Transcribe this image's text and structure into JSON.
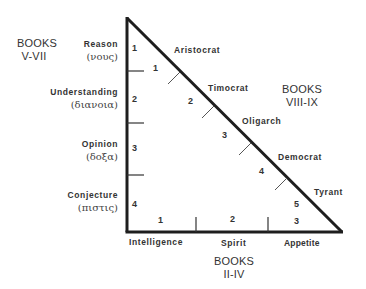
{
  "books_left": {
    "line1": "BOOKS",
    "line2": "V-VII"
  },
  "books_right": {
    "line1": "BOOKS",
    "line2": "VIII-IX"
  },
  "books_bottom": {
    "line1": "BOOKS",
    "line2": "II-IV"
  },
  "faculties": [
    {
      "name": "Reason",
      "greek": "(νους)",
      "num": "1"
    },
    {
      "name": "Understanding",
      "greek": "(διανοια)",
      "num": "2"
    },
    {
      "name": "Opinion",
      "greek": "(δοξα)",
      "num": "3"
    },
    {
      "name": "Conjecture",
      "greek": "(πιστις)",
      "num": "4"
    }
  ],
  "regimes": [
    {
      "name": "Aristocrat",
      "num": "1"
    },
    {
      "name": "Timocrat",
      "num": "2"
    },
    {
      "name": "Oligarch",
      "num": "3"
    },
    {
      "name": "Democrat",
      "num": "4"
    },
    {
      "name": "Tyrant",
      "num": "5"
    }
  ],
  "soul_parts": [
    {
      "name": "Intelligence",
      "num": "1"
    },
    {
      "name": "Spirit",
      "num": "2"
    },
    {
      "name": "Appetite",
      "num": "3"
    }
  ],
  "colors": {
    "line": "#1e1e1e",
    "text": "#333333"
  }
}
